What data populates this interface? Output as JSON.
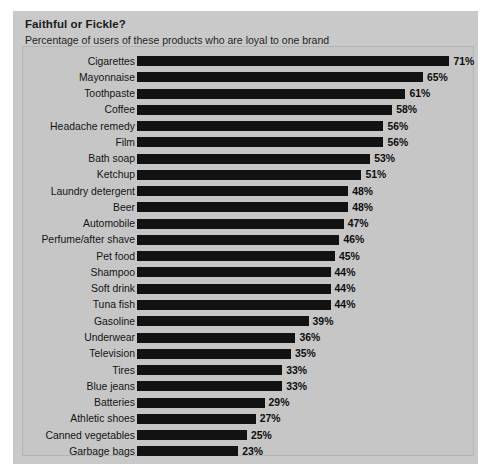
{
  "chart": {
    "title": "Faithful or Fickle?",
    "subtitle": "Percentage of users of these products who are loyal to one brand",
    "panel_color": "#c9c9c9",
    "plot_color": "#c6c6c6",
    "bar_color": "#121212"
  },
  "chart_data": {
    "type": "bar",
    "orientation": "horizontal",
    "title": "Faithful or Fickle?",
    "subtitle": "Percentage of users of these products who are loyal to one brand",
    "xlabel": "",
    "ylabel": "",
    "xlim": [
      0,
      75
    ],
    "grid": false,
    "legend": null,
    "value_suffix": "%",
    "categories": [
      "Cigarettes",
      "Mayonnaise",
      "Toothpaste",
      "Coffee",
      "Headache remedy",
      "Film",
      "Bath soap",
      "Ketchup",
      "Laundry detergent",
      "Beer",
      "Automobile",
      "Perfume/after shave",
      "Pet food",
      "Shampoo",
      "Soft drink",
      "Tuna fish",
      "Gasoline",
      "Underwear",
      "Television",
      "Tires",
      "Blue jeans",
      "Batteries",
      "Athletic shoes",
      "Canned vegetables",
      "Garbage bags"
    ],
    "values": [
      71,
      65,
      61,
      58,
      56,
      56,
      53,
      51,
      48,
      48,
      47,
      46,
      45,
      44,
      44,
      44,
      39,
      36,
      35,
      33,
      33,
      29,
      27,
      25,
      23
    ],
    "value_labels": [
      "71%",
      "65%",
      "61%",
      "58%",
      "56%",
      "56%",
      "53%",
      "51%",
      "48%",
      "48%",
      "47%",
      "46%",
      "45%",
      "44%",
      "44%",
      "44%",
      "39%",
      "36%",
      "35%",
      "33%",
      "33%",
      "29%",
      "27%",
      "25%",
      "23%"
    ]
  }
}
